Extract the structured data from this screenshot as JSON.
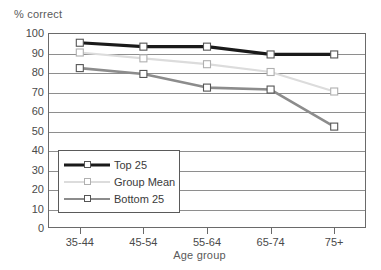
{
  "chart_data": {
    "type": "line",
    "title": "",
    "xlabel": "Age group",
    "ylabel": "% correct",
    "categories": [
      "35-44",
      "45-54",
      "55-64",
      "65-74",
      "75+"
    ],
    "ylim": [
      0,
      100
    ],
    "yticks": [
      0,
      10,
      20,
      30,
      40,
      50,
      60,
      70,
      80,
      90,
      100
    ],
    "grid": true,
    "legend_position": "inside-lower-left",
    "series": [
      {
        "name": "Top 25",
        "color": "#1a1a1a",
        "line_width": 3.2,
        "marker": "square-open",
        "values": [
          95,
          93,
          93,
          89,
          89
        ]
      },
      {
        "name": "Group Mean",
        "color": "#dcdcdc",
        "line_width": 2.2,
        "marker": "square-open",
        "values": [
          90,
          87,
          84,
          80,
          70
        ]
      },
      {
        "name": "Bottom 25",
        "color": "#8c8c8c",
        "line_width": 2.6,
        "marker": "square-open",
        "values": [
          82,
          79,
          72,
          71,
          52
        ]
      }
    ]
  },
  "axis": {
    "y_title": "% correct",
    "x_title": "Age group"
  }
}
